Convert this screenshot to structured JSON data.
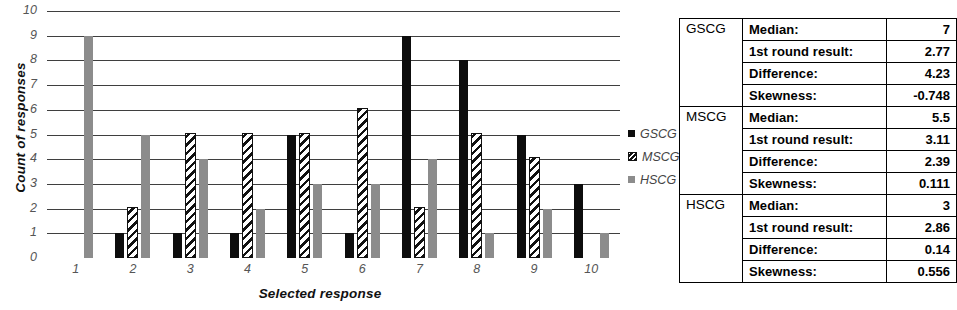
{
  "chart_data": {
    "type": "bar",
    "title": "",
    "xlabel": "Selected response",
    "ylabel": "Count of responses",
    "categories": [
      "1",
      "2",
      "3",
      "4",
      "5",
      "6",
      "7",
      "8",
      "9",
      "10"
    ],
    "ylim": [
      0,
      10
    ],
    "yticks": [
      "10",
      "9",
      "8",
      "7",
      "6",
      "5",
      "4",
      "3",
      "2",
      "1",
      "0"
    ],
    "grid": true,
    "legend_position": "right",
    "series": [
      {
        "name": "GSCG",
        "color": "#0d0d0d",
        "pattern": "solid-black",
        "values": [
          0,
          1,
          1,
          1,
          5,
          1,
          9,
          8,
          5,
          3
        ]
      },
      {
        "name": "MSCG",
        "color": "#111111",
        "pattern": "diagonal-hatch",
        "values": [
          0,
          2,
          5,
          5,
          5,
          6,
          2,
          5,
          4,
          0
        ]
      },
      {
        "name": "HSCG",
        "color": "#8c8c8c",
        "pattern": "solid-gray",
        "values": [
          9,
          5,
          4,
          2,
          3,
          3,
          4,
          1,
          2,
          1
        ]
      }
    ]
  },
  "legend": {
    "items": [
      {
        "label": "GSCG",
        "swatch": "solid-black"
      },
      {
        "label": "MSCG",
        "swatch": "diagonal-hatch"
      },
      {
        "label": "HSCG",
        "swatch": "solid-gray"
      }
    ]
  },
  "stats_table": {
    "row_labels": [
      "Median:",
      "1st round result:",
      "Difference:",
      "Skewness:"
    ],
    "groups": [
      {
        "name": "GSCG",
        "values": [
          "7",
          "2.77",
          "4.23",
          "-0.748"
        ]
      },
      {
        "name": "MSCG",
        "values": [
          "5.5",
          "3.11",
          "2.39",
          "0.111"
        ]
      },
      {
        "name": "HSCG",
        "values": [
          "3",
          "2.86",
          "0.14",
          "0.556"
        ]
      }
    ]
  }
}
